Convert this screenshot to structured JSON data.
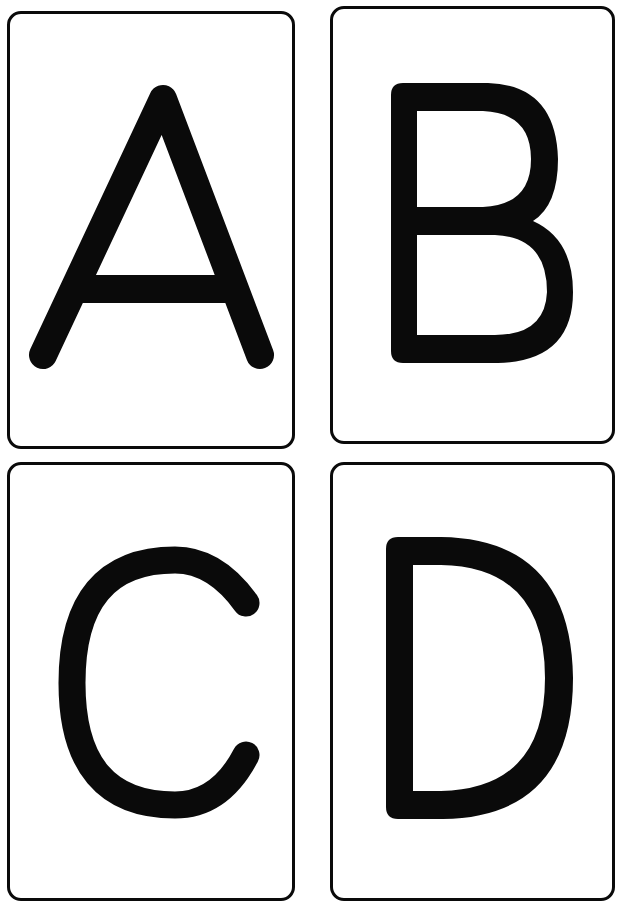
{
  "document": {
    "type": "alphabet flashcards",
    "layout": "2x2 grid",
    "colors": {
      "background": "#ffffff",
      "ink": "#0a0a0a"
    }
  },
  "cards": [
    {
      "letter": "A",
      "position": "top-left"
    },
    {
      "letter": "B",
      "position": "top-right"
    },
    {
      "letter": "C",
      "position": "bottom-left"
    },
    {
      "letter": "D",
      "position": "bottom-right"
    }
  ]
}
